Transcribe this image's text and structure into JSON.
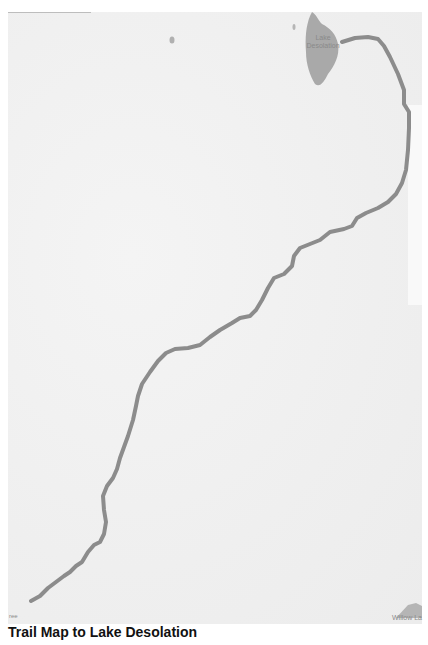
{
  "map": {
    "title": "Trail Map to Lake Desolation",
    "labels": {
      "lake": "Lake\nDesolation",
      "lake_line1": "Lake",
      "lake_line2": "Desolation",
      "bottom_left": "ree",
      "bottom_right": "Willow La"
    },
    "colors": {
      "background": "#f1f1f1",
      "water": "#a9a9a9",
      "route": "#8c8c8c",
      "label": "#8a8a8a",
      "caption": "#111111"
    },
    "route_points": [
      [
        31,
        601
      ],
      [
        40,
        596
      ],
      [
        48,
        588
      ],
      [
        56,
        582
      ],
      [
        64,
        576
      ],
      [
        70,
        572
      ],
      [
        76,
        566
      ],
      [
        82,
        562
      ],
      [
        88,
        552
      ],
      [
        94,
        545
      ],
      [
        100,
        542
      ],
      [
        104,
        534
      ],
      [
        106,
        522
      ],
      [
        104,
        510
      ],
      [
        103,
        496
      ],
      [
        107,
        486
      ],
      [
        113,
        478
      ],
      [
        117,
        469
      ],
      [
        120,
        458
      ],
      [
        124,
        447
      ],
      [
        128,
        436
      ],
      [
        133,
        420
      ],
      [
        136,
        406
      ],
      [
        138,
        396
      ],
      [
        142,
        384
      ],
      [
        150,
        372
      ],
      [
        158,
        361
      ],
      [
        166,
        353
      ],
      [
        175,
        349
      ],
      [
        188,
        348
      ],
      [
        200,
        345
      ],
      [
        210,
        337
      ],
      [
        220,
        330
      ],
      [
        232,
        323
      ],
      [
        240,
        318
      ],
      [
        250,
        316
      ],
      [
        256,
        310
      ],
      [
        262,
        300
      ],
      [
        268,
        288
      ],
      [
        274,
        278
      ],
      [
        284,
        274
      ],
      [
        292,
        266
      ],
      [
        294,
        256
      ],
      [
        300,
        248
      ],
      [
        310,
        244
      ],
      [
        320,
        240
      ],
      [
        330,
        232
      ],
      [
        344,
        229
      ],
      [
        352,
        226
      ],
      [
        357,
        218
      ],
      [
        366,
        213
      ],
      [
        378,
        208
      ],
      [
        388,
        202
      ],
      [
        396,
        194
      ],
      [
        402,
        183
      ],
      [
        406,
        170
      ],
      [
        408,
        150
      ],
      [
        409,
        128
      ],
      [
        409,
        112
      ],
      [
        404,
        104
      ],
      [
        404,
        90
      ],
      [
        398,
        74
      ],
      [
        390,
        57
      ],
      [
        384,
        46
      ],
      [
        378,
        39
      ],
      [
        368,
        37
      ],
      [
        355,
        38
      ],
      [
        342,
        42
      ]
    ],
    "lake_shape": "M312,12 C316,14 318,20 322,24 C330,28 336,34 338,44 C340,56 334,66 328,74 C324,82 320,88 315,84 C310,76 306,64 306,52 C305,38 306,26 310,16 Z"
  }
}
